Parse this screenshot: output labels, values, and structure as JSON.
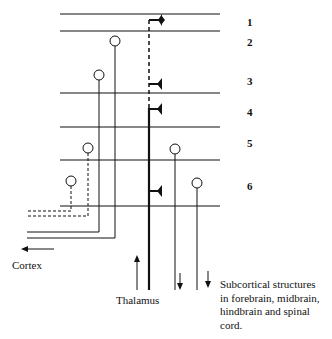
{
  "diagram": {
    "layers": [
      "1",
      "2",
      "3",
      "4",
      "5",
      "6"
    ],
    "labels": {
      "cortex": "Cortex",
      "thalamus": "Thalamus",
      "subcortical": "Subcortical structures in forebrain, midbrain, hindbrain and spinal cord."
    },
    "subcortical_lines": [
      "Subcortical structures",
      "in forebrain, midbrain,",
      "hindbrain and spinal",
      "cord."
    ]
  }
}
